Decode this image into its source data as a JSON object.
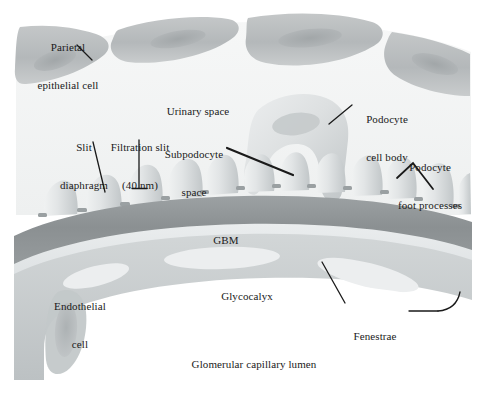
{
  "figure": {
    "background_color": "#ffffff",
    "ink_color": "#1a1a1a",
    "palette": {
      "parietal_cell_fill": "#b9bcbd",
      "parietal_cell_shade": "#a4a8aa",
      "urinary_space_fill": "#f2f3f3",
      "podocyte_fill": "#d8dcdd",
      "podocyte_shade": "#c3c8ca",
      "gbm_fill": "#8f9496",
      "gbm_shade": "#9ea3a5",
      "glycocalyx_fill": "#e2e5e6",
      "endothelial_fill": "#c8ccce",
      "endothelial_shade": "#b0b5b7",
      "lumen_fill": "#ffffff",
      "slit_diaphragm_fill": "#9aa0a2"
    }
  },
  "labels": {
    "parietal_epithelial_cell": {
      "text": "Parietal\nepithelial cell",
      "lines": [
        "Parietal",
        "epithelial cell"
      ],
      "x": 18,
      "y": 16,
      "width": 100,
      "align": "center"
    },
    "urinary_space": {
      "text": "Urinary space",
      "lines": [
        "Urinary space"
      ],
      "x": 152,
      "y": 80,
      "width": 92,
      "align": "center"
    },
    "slit_diaphragm": {
      "text": "Slit\ndiaphragm",
      "lines": [
        "Slit",
        "diaphragm"
      ],
      "x": 52,
      "y": 116,
      "width": 64,
      "align": "center"
    },
    "filtration_slit": {
      "text": "Filtration slit\n(40 nm)",
      "lines": [
        "Filtration slit",
        "(40 nm)"
      ],
      "x": 113,
      "y": 116,
      "width": 74,
      "align": "center"
    },
    "subpodocyte_space": {
      "text": "Subpodocyte\nspace",
      "lines": [
        "Subpodocyte",
        "space"
      ],
      "x": 157,
      "y": 123,
      "width": 82,
      "align": "center"
    },
    "podocyte_cell_body": {
      "text": "Podocyte\ncell body",
      "lines": [
        "Podocyte",
        "cell body"
      ],
      "x": 352,
      "y": 88,
      "width": 66,
      "align": "center"
    },
    "podocyte_foot_processes": {
      "text": "Podocyte\nfoot processes",
      "lines": [
        "Podocyte",
        "foot processes"
      ],
      "x": 385,
      "y": 136,
      "width": 90,
      "align": "center"
    },
    "gbm": {
      "text": "GBM",
      "lines": [
        "GBM"
      ],
      "x": 206,
      "y": 209,
      "width": 40,
      "align": "center"
    },
    "glycocalyx": {
      "text": "Glycocalyx",
      "lines": [
        "Glycocalyx"
      ],
      "x": 212,
      "y": 265,
      "width": 70,
      "align": "center"
    },
    "endothelial_cell": {
      "text": "Endothelial\ncell",
      "lines": [
        "Endothelial",
        "cell"
      ],
      "x": 47,
      "y": 275,
      "width": 66,
      "align": "center"
    },
    "fenestrae": {
      "text": "Fenestrae",
      "lines": [
        "Fenestrae"
      ],
      "x": 344,
      "y": 308,
      "width": 62,
      "align": "center"
    },
    "glomerular_capillary_lumen": {
      "text": "Glomerular capillary lumen",
      "lines": [
        "Glomerular capillary lumen"
      ],
      "x": 178,
      "y": 333,
      "width": 150,
      "align": "center"
    }
  },
  "leader_lines": [
    {
      "name": "parietal-epithelial-cell-leader",
      "x1": 77,
      "y1": 45,
      "x2": 92,
      "y2": 60
    },
    {
      "name": "slit-diaphragm-leader",
      "x1": 93,
      "y1": 142,
      "x2": 105,
      "y2": 192
    },
    {
      "name": "filtration-slit-leader",
      "x1": 139,
      "y1": 140,
      "x2": 139,
      "y2": 188
    },
    {
      "name": "filtration-slit-tick",
      "x1": 132,
      "y1": 188,
      "x2": 147,
      "y2": 188
    },
    {
      "name": "subpodocyte-space-leader",
      "x1": 227,
      "y1": 148,
      "x2": 293,
      "y2": 175
    },
    {
      "name": "podocyte-cell-body-leader",
      "x1": 350,
      "y1": 106,
      "x2": 330,
      "y2": 124
    },
    {
      "name": "podocyte-foot-processes-leader-left",
      "x1": 413,
      "y1": 163,
      "x2": 397,
      "y2": 178
    },
    {
      "name": "podocyte-foot-processes-leader-right",
      "x1": 413,
      "y1": 163,
      "x2": 433,
      "y2": 188
    },
    {
      "name": "fenestrae-leader",
      "x1": 408,
      "y1": 311,
      "x2": 440,
      "y2": 311
    },
    {
      "name": "glycocalyx-fenestrae-leader",
      "x1": 322,
      "y1": 262,
      "x2": 345,
      "y2": 303
    }
  ],
  "structures": [
    {
      "name": "parietal-epithelial-cell-1",
      "type": "parietal-cell"
    },
    {
      "name": "parietal-epithelial-cell-2",
      "type": "parietal-cell"
    },
    {
      "name": "parietal-epithelial-cell-3",
      "type": "parietal-cell"
    },
    {
      "name": "parietal-epithelial-cell-4",
      "type": "parietal-cell"
    },
    {
      "name": "urinary-space-region",
      "type": "space"
    },
    {
      "name": "podocyte-cell-body-large",
      "type": "podocyte-body"
    },
    {
      "name": "podocyte-foot-process",
      "type": "foot-process",
      "count": 12
    },
    {
      "name": "slit-diaphragm",
      "type": "slit-diaphragm",
      "count": 11
    },
    {
      "name": "gbm-layer",
      "type": "membrane"
    },
    {
      "name": "glycocalyx-layer",
      "type": "membrane"
    },
    {
      "name": "endothelial-cell-body",
      "type": "endothelial"
    },
    {
      "name": "fenestra-gap",
      "type": "fenestra",
      "count": 4
    },
    {
      "name": "glomerular-capillary-lumen-region",
      "type": "space"
    }
  ]
}
